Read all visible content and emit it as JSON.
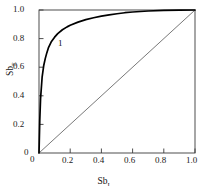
{
  "chart_data": {
    "type": "line",
    "title": "",
    "xlabel": "Sb",
    "xlabel_sub": "I",
    "ylabel": "Sb",
    "ylabel_sub": "E",
    "xlim": [
      0,
      1.0
    ],
    "ylim": [
      0,
      1.0
    ],
    "grid": false,
    "legend": "none",
    "xticks": [
      0,
      0.2,
      0.4,
      0.6,
      0.8,
      1.0
    ],
    "xtick_labels": [
      "0",
      "0.2",
      "0.4",
      "0.6",
      "0.8",
      "1.0"
    ],
    "yticks": [
      0,
      0.2,
      0.4,
      0.6,
      0.8,
      1.0
    ],
    "ytick_labels": [
      "0",
      "0.2",
      "0.4",
      "0.6",
      "0.8",
      "1.0"
    ],
    "annotations": [
      {
        "text": "1",
        "x": 0.135,
        "y": 0.76
      }
    ],
    "series": [
      {
        "name": "1",
        "style": "solid-thick",
        "color": "#000000",
        "x": [
          0,
          0.005,
          0.01,
          0.02,
          0.03,
          0.04,
          0.05,
          0.06,
          0.08,
          0.1,
          0.12,
          0.15,
          0.18,
          0.2,
          0.25,
          0.3,
          0.35,
          0.4,
          0.45,
          0.5,
          0.55,
          0.6,
          0.7,
          0.8,
          0.9,
          1.0
        ],
        "y": [
          0,
          0.23,
          0.38,
          0.53,
          0.61,
          0.66,
          0.7,
          0.735,
          0.78,
          0.81,
          0.835,
          0.862,
          0.882,
          0.893,
          0.915,
          0.933,
          0.946,
          0.957,
          0.966,
          0.974,
          0.981,
          0.986,
          0.993,
          0.997,
          0.999,
          1.0
        ]
      },
      {
        "name": "diagonal",
        "style": "solid-thin",
        "color": "#555555",
        "x": [
          0,
          1.0
        ],
        "y": [
          0,
          1.0
        ]
      }
    ]
  }
}
